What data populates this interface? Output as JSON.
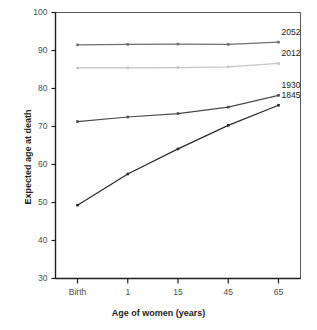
{
  "chart_data": {
    "type": "line",
    "title": "",
    "xlabel": "Age of women (years)",
    "ylabel": "Expected age at death",
    "categories": [
      "Birth",
      "1",
      "15",
      "45",
      "65"
    ],
    "x_numeric": [
      0,
      1,
      2,
      3,
      4
    ],
    "ylim": [
      30,
      100
    ],
    "yticks": [
      30,
      40,
      50,
      60,
      70,
      80,
      90,
      100
    ],
    "ytick_labels": [
      "30",
      "40",
      "50",
      "60",
      "70",
      "80",
      "90",
      "100"
    ],
    "grid": false,
    "legend_position": "right-inline-end-of-line",
    "series": [
      {
        "name": "2052",
        "label": "2052",
        "color": "#6e6e6e",
        "values": [
          91.5,
          91.6,
          91.7,
          91.6,
          92.2
        ],
        "label_y": 92.2
      },
      {
        "name": "2012",
        "label": "2012",
        "color": "#c4c4c4",
        "values": [
          85.4,
          85.4,
          85.5,
          85.7,
          86.6
        ],
        "label_y": 86.6
      },
      {
        "name": "1930",
        "label": "1930",
        "color": "#4a4a4a",
        "values": [
          71.3,
          72.5,
          73.4,
          75.1,
          78.2
        ],
        "label_y": 78.2
      },
      {
        "name": "1845",
        "label": "1845",
        "color": "#2b2b2b",
        "values": [
          49.3,
          57.5,
          64.1,
          70.3,
          75.6
        ],
        "label_y": 75.6
      }
    ]
  },
  "axis": {
    "y_title": "Expected age at death",
    "x_title": "Age of women (years)"
  },
  "colors": {
    "axis": "#231f20",
    "tick_text": "#4d4d4d",
    "plot_border": "#5a5a5a",
    "background": "#ffffff"
  }
}
